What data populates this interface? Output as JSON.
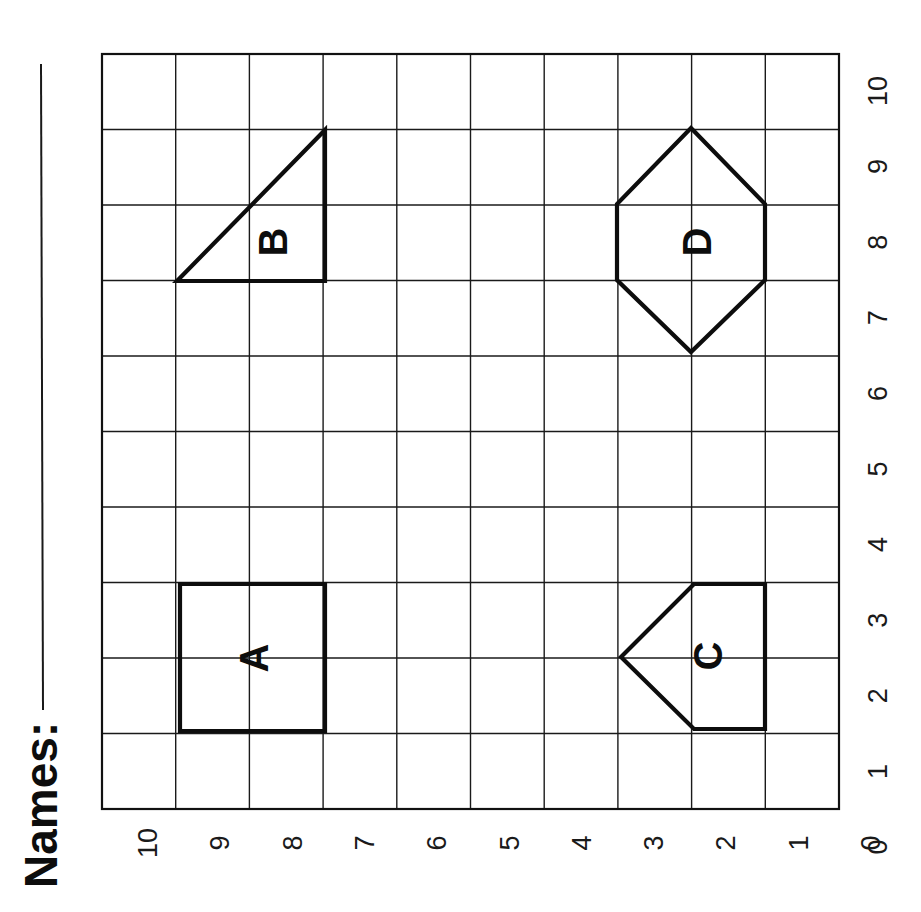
{
  "worksheet": {
    "names_label": "Names:",
    "orientation": "rotated 90° counter-clockwise",
    "grid": {
      "columns": 10,
      "rows": 10,
      "x_axis_labels": [
        "0",
        "1",
        "2",
        "3",
        "4",
        "5",
        "6",
        "7",
        "8",
        "9",
        "10"
      ],
      "y_axis_labels": [
        "0",
        "1",
        "2",
        "3",
        "4",
        "5",
        "6",
        "7",
        "8",
        "9",
        "10"
      ]
    },
    "shapes": [
      {
        "label": "A",
        "type": "square",
        "vertices": [
          [
            2,
            7
          ],
          [
            4,
            7
          ],
          [
            4,
            9
          ],
          [
            2,
            9
          ]
        ]
      },
      {
        "label": "B",
        "type": "triangle",
        "vertices": [
          [
            7,
            9
          ],
          [
            9,
            7
          ],
          [
            7,
            7
          ]
        ]
      },
      {
        "label": "C",
        "type": "pentagon",
        "vertices": [
          [
            2,
            2
          ],
          [
            2,
            3
          ],
          [
            3,
            4
          ],
          [
            4,
            3
          ],
          [
            4,
            2
          ]
        ]
      },
      {
        "label": "D",
        "type": "hexagon",
        "vertices": [
          [
            7,
            3
          ],
          [
            7,
            2
          ],
          [
            8,
            1
          ],
          [
            9,
            2
          ],
          [
            9,
            3
          ],
          [
            8,
            4
          ]
        ]
      }
    ]
  }
}
